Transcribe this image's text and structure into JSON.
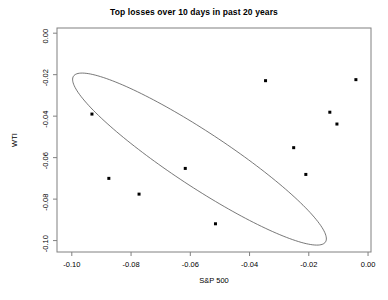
{
  "chart_data": {
    "type": "scatter",
    "title": "Top losses over 10 days in past 20 years",
    "xlabel": "S&P 500",
    "ylabel": "WTI",
    "xlim": [
      -0.105,
      0.001
    ],
    "ylim": [
      -0.1055,
      0.0025
    ],
    "grid": false,
    "legend": null,
    "xticks": [
      -0.1,
      -0.08,
      -0.06,
      -0.04,
      -0.02,
      0.0
    ],
    "xticklabels": [
      "-0.10",
      "-0.08",
      "-0.06",
      "-0.04",
      "-0.02",
      "0.00"
    ],
    "yticks": [
      0.0,
      -0.02,
      -0.04,
      -0.06,
      -0.08,
      -0.1
    ],
    "yticklabels": [
      "0.00",
      "-0.02",
      "-0.04",
      "-0.06",
      "-0.08",
      "-0.10"
    ],
    "points": [
      {
        "x": -0.0932,
        "y": -0.039
      },
      {
        "x": -0.0875,
        "y": -0.07
      },
      {
        "x": -0.0773,
        "y": -0.0776
      },
      {
        "x": -0.0617,
        "y": -0.0652
      },
      {
        "x": -0.0515,
        "y": -0.0919
      },
      {
        "x": -0.0346,
        "y": -0.0229
      },
      {
        "x": -0.0251,
        "y": -0.0552
      },
      {
        "x": -0.021,
        "y": -0.0681
      },
      {
        "x": -0.0129,
        "y": -0.0381
      },
      {
        "x": -0.0105,
        "y": -0.0438
      },
      {
        "x": -0.0041,
        "y": -0.0224
      }
    ],
    "annotations": [
      {
        "kind": "confidence-ellipse",
        "center_x": -0.0569,
        "center_y": -0.0607,
        "semi_major": 0.0585,
        "semi_minor": 0.0115,
        "angle_deg": -44
      }
    ],
    "marker": {
      "shape": "square",
      "size_px": 3,
      "color": "#000000"
    },
    "ellipse_color": "#555555",
    "frame_color": "#808080",
    "background": "#ffffff"
  }
}
